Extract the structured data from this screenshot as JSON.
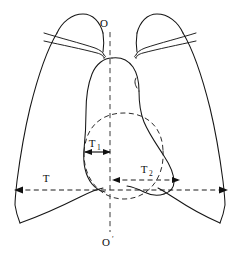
{
  "figure": {
    "kind": "chest-radiograph-schematic",
    "background_color": "#ffffff",
    "line_color": "#161616",
    "dash_color": "#2b2b2b"
  },
  "labels": {
    "axis_top": {
      "text": "O",
      "x": 107,
      "y": 26,
      "meaning": "superior end of midline vertical axis"
    },
    "axis_bottom": {
      "text": "O",
      "prime": "′",
      "x": 106,
      "y": 245,
      "meaning": "inferior end of midline vertical axis"
    },
    "thoracic_width": {
      "text": "T",
      "x": 45,
      "y": 181,
      "meaning": "maximum internal thoracic transverse diameter"
    },
    "cardiac_right": {
      "text": "T",
      "sub": "1",
      "x": 93,
      "y": 146,
      "meaning": "cardiac extension right of midline"
    },
    "cardiac_left": {
      "text": "T",
      "sub": "2",
      "x": 144,
      "y": 172,
      "meaning": "cardiac extension left of midline"
    }
  },
  "measurements": [
    {
      "name": "T",
      "style": "dashed",
      "arrows": "both",
      "x1": 14,
      "x2": 228,
      "y": 190
    },
    {
      "name": "T1",
      "style": "solid",
      "arrows": "both",
      "x1": 85,
      "x2": 110,
      "y": 152
    },
    {
      "name": "T2",
      "style": "dashed",
      "arrows": "both",
      "x1": 112,
      "x2": 180,
      "y": 180
    }
  ],
  "axis": {
    "name": "midline-vertical-axis",
    "style": "dashed",
    "x": 110,
    "y1": 32,
    "y2": 232
  },
  "parts": [
    {
      "name": "left-lung-field",
      "side": "image-left"
    },
    {
      "name": "right-lung-field",
      "side": "image-right"
    },
    {
      "name": "left-clavicle",
      "side": "image-left"
    },
    {
      "name": "right-clavicle",
      "side": "image-right"
    },
    {
      "name": "cardiac-silhouette",
      "side": "center"
    },
    {
      "name": "aortic-arch",
      "side": "center"
    },
    {
      "name": "left-hemidiaphragm",
      "side": "image-left"
    },
    {
      "name": "right-hemidiaphragm",
      "side": "image-right"
    },
    {
      "name": "cardiac-base-dashed-outline",
      "side": "center"
    }
  ]
}
